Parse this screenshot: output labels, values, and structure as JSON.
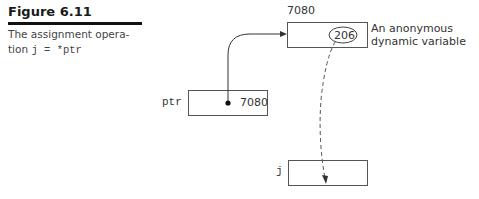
{
  "figure": {
    "number": "Figure 6.11",
    "caption_text": "The assignment opera-tion ",
    "caption_line1": "The assignment opera-",
    "caption_line2_prefix": "tion ",
    "caption_code": "j = *ptr"
  },
  "diagram": {
    "dynamic_var": {
      "address": "7080",
      "value": "206",
      "annotation_line1": "An anonymous",
      "annotation_line2": "dynamic variable"
    },
    "ptr": {
      "name": "ptr",
      "value": "7080"
    },
    "j": {
      "name": "j",
      "value": ""
    }
  }
}
